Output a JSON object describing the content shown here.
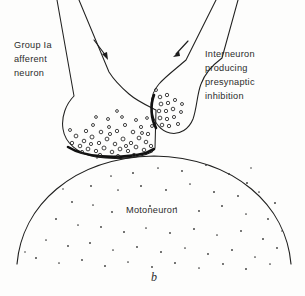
{
  "figure": {
    "caption": "b",
    "background_color": "#fdfdfc",
    "ink_color": "#20201f",
    "text_color": "#2b2b2b"
  },
  "labels": {
    "left": {
      "name": "group-ia-afferent-neuron",
      "lines": [
        "Group Ia",
        "afferent",
        "neuron"
      ]
    },
    "right": {
      "name": "interneuron-presynaptic-inhibition",
      "lines": [
        "Interneuron",
        "producing",
        "presynaptic",
        "inhibition"
      ]
    },
    "soma": {
      "name": "motoneuron",
      "text": "Motoneuron"
    }
  },
  "diagram_data": {
    "type": "biological-schematic",
    "subject": "presynaptic inhibition at a Ia afferent axo-axonic synapse on a motoneuron",
    "structures": [
      {
        "id": "ia-afferent-axon",
        "label": "Group Ia afferent neuron",
        "description": "axon descending from upper left, expanding into a large synaptic terminal bouton filled with vesicles"
      },
      {
        "id": "interneuron-axon",
        "label": "Interneuron producing presynaptic inhibition",
        "description": "axon descending from upper right, ending in a smaller bouton that synapses onto the Ia terminal"
      },
      {
        "id": "motoneuron-soma",
        "label": "Motoneuron",
        "description": "large stippled cell body occupying the lower half of the figure"
      }
    ],
    "synapses": [
      {
        "id": "axo-axonic-synapse",
        "from": "interneuron-axon",
        "to": "ia-afferent-axon",
        "type": "presynaptic inhibition"
      },
      {
        "id": "axo-somatic-synapse",
        "from": "ia-afferent-axon",
        "to": "motoneuron-soma",
        "type": "excitatory"
      }
    ],
    "flow_arrows": [
      {
        "id": "ia-conduction-arrow",
        "direction": "down-right",
        "on": "ia-afferent-axon"
      },
      {
        "id": "interneuron-conduction-arrow",
        "direction": "down-left",
        "on": "interneuron-axon"
      }
    ],
    "vesicle_count_ia": 46,
    "vesicle_count_interneuron": 17,
    "stipple_count_soma": 62
  }
}
